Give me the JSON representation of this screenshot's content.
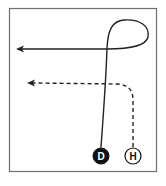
{
  "diagram": {
    "type": "path-diagram",
    "frame": {
      "x": 9,
      "y": 8,
      "width": 148,
      "height": 164,
      "stroke": "#6f6f6f"
    },
    "nodes": [
      {
        "id": "D",
        "label": "D",
        "cx": 101,
        "cy": 156,
        "r": 8,
        "fill": "#111111",
        "text_color": "#ffffff"
      },
      {
        "id": "H",
        "label": "H",
        "cx": 133,
        "cy": 156,
        "r": 8,
        "fill": "#ffffff",
        "text_color": "#111111"
      }
    ],
    "paths": [
      {
        "id": "solid-path",
        "from": "D",
        "style": "solid",
        "description": "rises from D, loops clockwise at top right, then heads left ending in an arrow"
      },
      {
        "id": "dashed-path",
        "from": "H",
        "style": "dashed",
        "description": "rises from H, curves left and ends in an arrow"
      }
    ],
    "colors": {
      "line": "#222222",
      "frame": "#6f6f6f",
      "background": "#ffffff"
    }
  }
}
